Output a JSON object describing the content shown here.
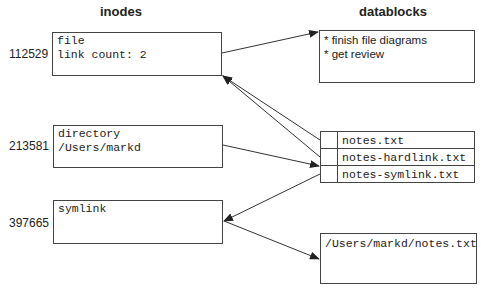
{
  "headings": {
    "inodes": "inodes",
    "datablocks": "datablocks"
  },
  "inodes": [
    {
      "number": "112529",
      "lines": [
        "file",
        "link count: 2"
      ]
    },
    {
      "number": "213581",
      "lines": [
        "directory",
        "/Users/markd"
      ]
    },
    {
      "number": "397665",
      "lines": [
        "symlink"
      ]
    }
  ],
  "datablocks": {
    "file_contents": [
      "* finish file diagrams",
      "* get review"
    ],
    "directory_entries": [
      "notes.txt",
      "notes-hardlink.txt",
      "notes-symlink.txt"
    ],
    "symlink_target": "/Users/markd/notes.txt"
  },
  "arrows": [
    {
      "from": "inode-file",
      "to": "datablock-file"
    },
    {
      "from": "dir-entry-notes.txt",
      "to": "inode-file"
    },
    {
      "from": "dir-entry-notes-hardlink.txt",
      "to": "inode-file"
    },
    {
      "from": "inode-directory",
      "to": "datablock-directory"
    },
    {
      "from": "dir-entry-notes-symlink.txt",
      "to": "inode-symlink"
    },
    {
      "from": "inode-symlink",
      "to": "datablock-symlink"
    }
  ]
}
